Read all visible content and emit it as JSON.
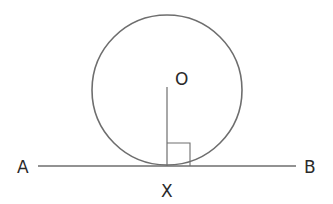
{
  "diagram": {
    "stroke_color": "#6e6e6e",
    "label_color": "#2a2a2a",
    "circle": {
      "center_label": "O",
      "cx": 167,
      "cy": 90,
      "r": 75
    },
    "tangent_line": {
      "start_label": "A",
      "end_label": "B",
      "y": 166,
      "x1": 38,
      "x2": 296
    },
    "point_of_contact": {
      "label": "X",
      "x": 167
    },
    "radius_segment": {
      "from": "O",
      "to": "X",
      "top_y": 87
    },
    "right_angle_marker": {
      "size": 23
    }
  }
}
